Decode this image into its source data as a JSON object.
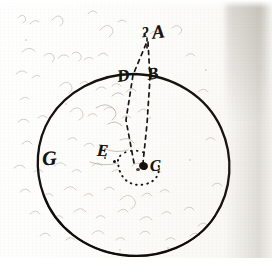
{
  "document": {
    "kind": "manuscript-diagram",
    "description": "Hand-drawn ink diagram on aged paper: a large irregular circle with dashed construction lines converging above it",
    "ink_color": "#171410",
    "paper_color": "#fdfdfc",
    "showthrough_color": "#b9b0a2"
  },
  "diagram": {
    "type": "geometric-sketch",
    "shape": {
      "name": "circle",
      "label": "main-circle",
      "cx": 136,
      "cy": 166,
      "rx": 97,
      "ry": 92
    },
    "labels": [
      {
        "id": "A",
        "text": "A",
        "x": 152,
        "y": 22,
        "note": "apex point above the circle"
      },
      {
        "id": "A-mark",
        "text": "ʔ",
        "x": 142,
        "y": 26,
        "note": "small flourish mark preceding A"
      },
      {
        "id": "D",
        "text": "D",
        "x": 117,
        "y": 67,
        "note": "left point on upper circumference"
      },
      {
        "id": "B",
        "text": "B",
        "x": 147,
        "y": 65,
        "note": "right point on upper circumference"
      },
      {
        "id": "E",
        "text": "E",
        "x": 97,
        "y": 142,
        "note": "interior point left of centre"
      },
      {
        "id": "C",
        "text": "C",
        "x": 150,
        "y": 158,
        "note": "centre point of the circle"
      },
      {
        "id": "G",
        "text": "G",
        "x": 42,
        "y": 148,
        "note": "point on the left circumference"
      }
    ],
    "dashed_lines": [
      {
        "from": "A",
        "to": "C",
        "via": "D",
        "style": "dashed",
        "note": "slanted line from apex through D to centre"
      },
      {
        "from": "A",
        "to": "C",
        "via": "B",
        "style": "dashed",
        "note": "near-vertical line from apex through B to centre"
      }
    ],
    "dotted_arc": {
      "around": "C",
      "style": "dotted",
      "note": "small dotted arc curving beneath the centre point"
    },
    "ink_blots": [
      {
        "x": 143,
        "y": 166,
        "r": 4,
        "note": "dark blot at centre point C"
      },
      {
        "x": 115,
        "y": 161,
        "r": 2,
        "note": "small dot left of centre"
      }
    ]
  },
  "background": {
    "showthrough_note": "faint brown script bleeding through from the reverse of the leaf",
    "gutter_note": "grey shading band along the right edge of the page"
  }
}
